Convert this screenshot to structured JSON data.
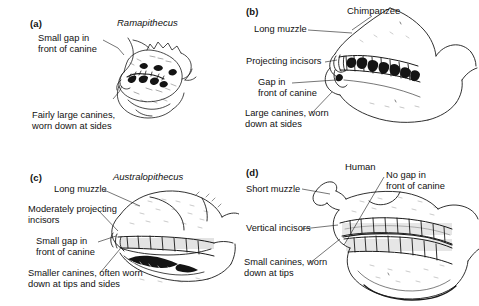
{
  "figure": {
    "type": "scientific-illustration",
    "background_color": "#ffffff",
    "ink_color": "#111111"
  },
  "panels": [
    {
      "key": "a",
      "letter": "(a)",
      "title": "Ramapithecus",
      "title_style": "italic",
      "labels": [
        {
          "name": "small-gap-label",
          "text": "Small gap in\nfront of canine"
        },
        {
          "name": "large-canines-label",
          "text": "Fairly large canines,\nworn down at sides"
        }
      ]
    },
    {
      "key": "b",
      "letter": "(b)",
      "title": "Chimpanzee",
      "title_style": "normal",
      "labels": [
        {
          "name": "long-muzzle-label",
          "text": "Long muzzle"
        },
        {
          "name": "projecting-incisors-label",
          "text": "Projecting incisors"
        },
        {
          "name": "gap-in-front-label",
          "text": "Gap in\nfront of canine"
        },
        {
          "name": "large-canines-label",
          "text": "Large canines, worn\ndown at sides"
        }
      ]
    },
    {
      "key": "c",
      "letter": "(c)",
      "title": "Australopithecus",
      "title_style": "italic",
      "labels": [
        {
          "name": "long-muzzle-label",
          "text": "Long muzzle"
        },
        {
          "name": "moderately-projecting-incisors-label",
          "text": "Moderately projecting\nincisors"
        },
        {
          "name": "small-gap-label",
          "text": "Small gap in\nfront of canine"
        },
        {
          "name": "smaller-canines-label",
          "text": "Smaller canines, often worn\ndown at tips and sides"
        }
      ]
    },
    {
      "key": "d",
      "letter": "(d)",
      "title": "Human",
      "title_style": "normal",
      "labels": [
        {
          "name": "no-gap-label",
          "text": "No gap in\nfront of canine"
        },
        {
          "name": "short-muzzle-label",
          "text": "Short muzzle"
        },
        {
          "name": "vertical-incisors-label",
          "text": "Vertical incisors"
        },
        {
          "name": "small-canines-label",
          "text": "Small canines, worn\ndown at tips"
        }
      ]
    }
  ]
}
